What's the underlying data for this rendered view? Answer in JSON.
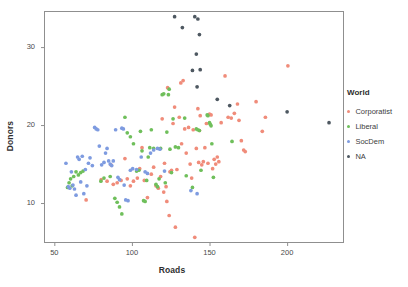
{
  "chart_data": {
    "type": "scatter",
    "title": "",
    "xlabel": "Roads",
    "ylabel": "Donors",
    "xlim": [
      44,
      236
    ],
    "ylim": [
      5.0,
      34.5
    ],
    "xticks": [
      50,
      100,
      150,
      200
    ],
    "yticks": [
      10,
      20,
      30
    ],
    "grid": false,
    "legend_title": "World",
    "legend_position": "right",
    "colors": {
      "Corporatist": "#F08C7A",
      "Liberal": "#6FBF5B",
      "SocDem": "#7E9BE0",
      "NA": "#4E5861"
    },
    "series": [
      {
        "name": "Corporatist",
        "color": "#F08C7A",
        "points": [
          [
            70.5,
            10.4
          ],
          [
            80.2,
            13.0
          ],
          [
            84.0,
            12.8
          ],
          [
            86.5,
            14.9
          ],
          [
            88.0,
            12.4
          ],
          [
            90.5,
            12.6
          ],
          [
            93.0,
            12.9
          ],
          [
            95.5,
            15.7
          ],
          [
            97.0,
            13.1
          ],
          [
            99.0,
            12.2
          ],
          [
            101.0,
            12.8
          ],
          [
            103.5,
            13.2
          ],
          [
            105.0,
            14.4
          ],
          [
            106.5,
            17.1
          ],
          [
            108.0,
            12.9
          ],
          [
            110.0,
            10.7
          ],
          [
            112.5,
            13.7
          ],
          [
            114.0,
            14.6
          ],
          [
            115.5,
            12.2
          ],
          [
            117.0,
            11.9
          ],
          [
            118.5,
            13.4
          ],
          [
            119.5,
            20.8
          ],
          [
            120.5,
            11.4
          ],
          [
            121.0,
            15.1
          ],
          [
            122.0,
            12.1
          ],
          [
            122.5,
            10.2
          ],
          [
            123.0,
            24.8
          ],
          [
            124.0,
            8.4
          ],
          [
            124.5,
            14.0
          ],
          [
            125.5,
            14.2
          ],
          [
            126.5,
            20.2
          ],
          [
            127.5,
            22.3
          ],
          [
            128.0,
            6.9
          ],
          [
            129.0,
            14.3
          ],
          [
            130.5,
            21.0
          ],
          [
            131.5,
            25.4
          ],
          [
            132.0,
            17.6
          ],
          [
            133.0,
            25.7
          ],
          [
            134.0,
            19.5
          ],
          [
            135.0,
            16.4
          ],
          [
            136.5,
            19.7
          ],
          [
            137.5,
            15.0
          ],
          [
            138.5,
            13.2
          ],
          [
            139.5,
            19.4
          ],
          [
            140.5,
            5.6
          ],
          [
            141.5,
            17.0
          ],
          [
            142.5,
            22.1
          ],
          [
            143.0,
            15.2
          ],
          [
            143.5,
            19.3
          ],
          [
            144.0,
            21.2
          ],
          [
            145.0,
            14.9
          ],
          [
            146.0,
            15.3
          ],
          [
            147.0,
            17.1
          ],
          [
            148.0,
            20.2
          ],
          [
            149.0,
            15.1
          ],
          [
            150.0,
            21.4
          ],
          [
            151.0,
            21.3
          ],
          [
            152.0,
            14.4
          ],
          [
            153.0,
            15.6
          ],
          [
            154.0,
            15.0
          ],
          [
            155.0,
            15.9
          ],
          [
            156.0,
            15.3
          ],
          [
            157.5,
            20.3
          ],
          [
            160.0,
            26.3
          ],
          [
            162.0,
            21.0
          ],
          [
            164.0,
            20.9
          ],
          [
            166.0,
            21.5
          ],
          [
            168.0,
            22.7
          ],
          [
            169.0,
            20.6
          ],
          [
            170.5,
            18.0
          ],
          [
            172.0,
            16.8
          ],
          [
            173.0,
            16.6
          ],
          [
            180.0,
            23.0
          ],
          [
            184.0,
            19.2
          ],
          [
            186.0,
            21.0
          ],
          [
            200.5,
            27.6
          ]
        ]
      },
      {
        "name": "Liberal",
        "color": "#6FBF5B",
        "points": [
          [
            58.5,
            12.0
          ],
          [
            59.5,
            12.6
          ],
          [
            60.5,
            13.1
          ],
          [
            61.5,
            12.2
          ],
          [
            62.5,
            13.4
          ],
          [
            64.0,
            14.0
          ],
          [
            65.5,
            13.6
          ],
          [
            67.0,
            13.9
          ],
          [
            68.5,
            14.1
          ],
          [
            80.0,
            12.8
          ],
          [
            82.0,
            13.2
          ],
          [
            86.0,
            13.4
          ],
          [
            89.0,
            10.6
          ],
          [
            90.5,
            10.1
          ],
          [
            92.0,
            9.5
          ],
          [
            93.5,
            8.6
          ],
          [
            95.5,
            21.0
          ],
          [
            97.0,
            19.0
          ],
          [
            99.0,
            18.5
          ],
          [
            101.0,
            17.6
          ],
          [
            103.0,
            14.1
          ],
          [
            104.5,
            14.2
          ],
          [
            105.5,
            19.2
          ],
          [
            106.5,
            16.7
          ],
          [
            107.5,
            10.3
          ],
          [
            108.5,
            10.2
          ],
          [
            109.5,
            12.9
          ],
          [
            110.5,
            15.9
          ],
          [
            111.5,
            17.1
          ],
          [
            112.5,
            19.4
          ],
          [
            114.0,
            17.0
          ],
          [
            115.5,
            12.4
          ],
          [
            116.5,
            12.1
          ],
          [
            117.5,
            13.1
          ],
          [
            118.5,
            17.0
          ],
          [
            119.5,
            23.9
          ],
          [
            120.5,
            24.0
          ],
          [
            121.5,
            12.6
          ],
          [
            122.5,
            19.1
          ],
          [
            123.5,
            23.9
          ],
          [
            124.0,
            24.6
          ],
          [
            124.5,
            16.9
          ],
          [
            125.5,
            13.9
          ],
          [
            126.5,
            20.8
          ],
          [
            128.0,
            17.2
          ],
          [
            130.0,
            17.1
          ],
          [
            134.0,
            20.9
          ],
          [
            135.0,
            13.5
          ],
          [
            139.0,
            12.0
          ],
          [
            141.5,
            19.5
          ],
          [
            142.5,
            19.4
          ],
          [
            143.5,
            19.3
          ],
          [
            144.5,
            14.2
          ],
          [
            148.5,
            21.3
          ],
          [
            149.0,
            21.2
          ],
          [
            150.0,
            20.3
          ],
          [
            150.5,
            20.1
          ],
          [
            151.0,
            19.9
          ],
          [
            151.5,
            17.6
          ],
          [
            152.5,
            13.3
          ],
          [
            164.5,
            17.9
          ]
        ]
      },
      {
        "name": "SocDem",
        "color": "#7E9BE0",
        "points": [
          [
            57.5,
            15.1
          ],
          [
            59.0,
            12.1
          ],
          [
            60.0,
            11.9
          ],
          [
            61.0,
            14.0
          ],
          [
            62.0,
            12.3
          ],
          [
            63.0,
            11.8
          ],
          [
            64.0,
            11.0
          ],
          [
            65.0,
            15.9
          ],
          [
            66.0,
            15.6
          ],
          [
            67.0,
            12.7
          ],
          [
            68.0,
            16.0
          ],
          [
            69.0,
            11.2
          ],
          [
            70.0,
            14.3
          ],
          [
            71.0,
            12.2
          ],
          [
            72.0,
            15.1
          ],
          [
            73.0,
            15.8
          ],
          [
            74.5,
            14.8
          ],
          [
            76.0,
            19.7
          ],
          [
            77.0,
            19.5
          ],
          [
            78.0,
            19.4
          ],
          [
            79.0,
            17.3
          ],
          [
            80.5,
            14.9
          ],
          [
            82.0,
            15.2
          ],
          [
            83.0,
            16.4
          ],
          [
            84.0,
            17.0
          ],
          [
            85.0,
            15.4
          ],
          [
            86.0,
            15.0
          ],
          [
            87.0,
            14.8
          ],
          [
            88.0,
            15.4
          ],
          [
            89.5,
            19.4
          ],
          [
            91.0,
            13.3
          ],
          [
            92.0,
            13.0
          ],
          [
            93.5,
            19.6
          ],
          [
            94.5,
            19.5
          ],
          [
            95.0,
            12.3
          ],
          [
            96.0,
            10.4
          ],
          [
            97.5,
            10.3
          ],
          [
            99.0,
            14.2
          ],
          [
            100.5,
            14.4
          ],
          [
            103.0,
            14.3
          ],
          [
            106.0,
            15.9
          ],
          [
            108.5,
            14.0
          ],
          [
            110.0,
            13.8
          ],
          [
            112.0,
            16.4
          ],
          [
            114.0,
            16.8
          ],
          [
            116.5,
            17.0
          ],
          [
            118.0,
            16.9
          ],
          [
            121.0,
            14.1
          ],
          [
            138.0,
            11.6
          ],
          [
            142.0,
            11.2
          ]
        ]
      },
      {
        "name": "NA",
        "color": "#4E5861",
        "points": [
          [
            127.5,
            33.9
          ],
          [
            132.5,
            32.5
          ],
          [
            140.5,
            33.9
          ],
          [
            142.5,
            33.6
          ],
          [
            143.5,
            31.6
          ],
          [
            141.5,
            29.1
          ],
          [
            139.0,
            27.0
          ],
          [
            144.0,
            27.1
          ],
          [
            142.0,
            24.9
          ],
          [
            155.0,
            23.3
          ],
          [
            163.0,
            22.5
          ],
          [
            200.0,
            21.7
          ],
          [
            227.0,
            20.3
          ]
        ]
      }
    ]
  },
  "axes": {
    "x_tick_labels": [
      "50",
      "100",
      "150",
      "200"
    ],
    "y_tick_labels": [
      "30",
      "20",
      "10"
    ],
    "x_title": "Roads",
    "y_title": "Donors"
  },
  "legend": {
    "title": "World",
    "items": [
      {
        "label": "Corporatist",
        "color": "#F08C7A"
      },
      {
        "label": "Liberal",
        "color": "#6FBF5B"
      },
      {
        "label": "SocDem",
        "color": "#7E9BE0"
      },
      {
        "label": "NA",
        "color": "#4E5861"
      }
    ]
  },
  "panel": {
    "border_color": "#8f8f8f",
    "background": "#ffffff"
  }
}
